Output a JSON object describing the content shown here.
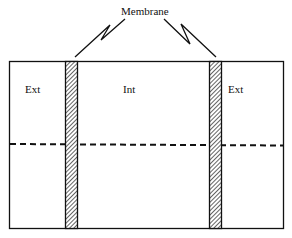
{
  "diagram": {
    "title_label": "Membrane",
    "regions": {
      "left": "Ext",
      "middle": "Int",
      "right": "Ext"
    },
    "colors": {
      "stroke": "#111111",
      "background": "#ffffff",
      "hatch": "#111111"
    },
    "elements": {
      "outer_box": {
        "x": 9,
        "y": 61,
        "width": 274,
        "height": 167
      },
      "membranes": [
        {
          "id": "left-membrane",
          "x": 65,
          "width": 12
        },
        {
          "id": "right-membrane",
          "x": 209,
          "width": 12
        }
      ],
      "dashed_line": {
        "y_left": 144,
        "y_right": 145
      }
    }
  }
}
